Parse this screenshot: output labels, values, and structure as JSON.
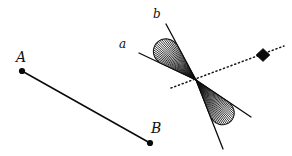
{
  "figure": {
    "width": 292,
    "height": 156,
    "background_color": "#ffffff",
    "ink_color": "#0a0a0a"
  },
  "labels": {
    "point_a": "A",
    "point_b": "B",
    "ray_a": "a",
    "ray_b": "b"
  },
  "segment": {
    "name": "AB",
    "endpoint_a": {
      "x": 22,
      "y": 71
    },
    "endpoint_b": {
      "x": 150,
      "y": 143
    },
    "dot_radius": 3.1,
    "stroke_width": 1.5
  },
  "angle": {
    "vertex": {
      "x": 196,
      "y": 80
    },
    "ray_a_end": {
      "x": 139,
      "y": 53
    },
    "ray_b_end": {
      "x": 166,
      "y": 24
    },
    "opposite_ray_a_end": {
      "x": 251,
      "y": 117
    },
    "opposite_ray_b_end": {
      "x": 223,
      "y": 149
    },
    "hatch_count": 18,
    "arc_radius_upper": 54,
    "arc_radius_lower": 54,
    "hatch_color": "#111111"
  },
  "dotted_line": {
    "start": {
      "x": 171,
      "y": 88
    },
    "end": {
      "x": 284,
      "y": 46
    },
    "dash_pattern": "1.1 2.9",
    "stroke_width": 1.5,
    "marker": {
      "shape": "diamond",
      "x": 263,
      "y": 55,
      "half_width": 7,
      "half_height": 6.5,
      "fill": "#0a0a0a"
    }
  },
  "chart_data": {
    "type": "scatter",
    "xlabel": "",
    "ylabel": "",
    "xlim": [
      0,
      292
    ],
    "ylim": [
      0,
      156
    ],
    "grid": false,
    "legend": "none",
    "annotations": [
      "A",
      "B",
      "a",
      "b"
    ],
    "points": [
      {
        "label": "A",
        "x": 22,
        "y": 71
      },
      {
        "label": "B",
        "x": 150,
        "y": 143
      },
      {
        "label": "vertex",
        "x": 196,
        "y": 80
      },
      {
        "label": "diamond-marker",
        "x": 263,
        "y": 55
      }
    ],
    "series": [
      {
        "name": "segment-AB",
        "style": "solid",
        "x": [
          22,
          150
        ],
        "y": [
          71,
          143
        ]
      },
      {
        "name": "ray-a",
        "style": "solid",
        "x": [
          196,
          139
        ],
        "y": [
          80,
          53
        ]
      },
      {
        "name": "ray-b",
        "style": "solid",
        "x": [
          196,
          166
        ],
        "y": [
          80,
          24
        ]
      },
      {
        "name": "ray-a-opposite",
        "style": "solid",
        "x": [
          196,
          251
        ],
        "y": [
          80,
          117
        ]
      },
      {
        "name": "ray-b-opposite",
        "style": "solid",
        "x": [
          196,
          223
        ],
        "y": [
          80,
          149
        ]
      },
      {
        "name": "dotted-transversal",
        "style": "dotted",
        "x": [
          171,
          284
        ],
        "y": [
          88,
          46
        ]
      }
    ]
  }
}
